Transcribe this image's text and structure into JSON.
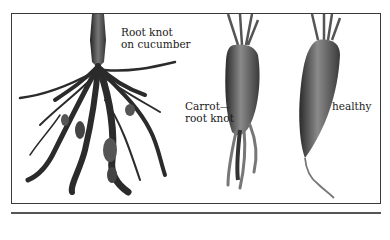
{
  "figure": {
    "labels": {
      "cucumber": "Root knot\non cucumber",
      "carrot_knot": "Carrot—\nroot knot",
      "healthy": "healthy"
    },
    "illustrations": [
      {
        "name": "cucumber-root-knot",
        "description": "Cucumber root with root-knot galls"
      },
      {
        "name": "carrot-root-knot",
        "description": "Carrot affected by root knot with forked galled roots"
      },
      {
        "name": "carrot-healthy",
        "description": "Healthy tapered carrot"
      }
    ]
  }
}
